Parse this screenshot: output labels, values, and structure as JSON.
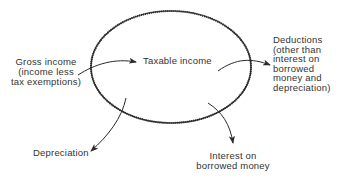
{
  "diagram": {
    "center_label": "Taxable income",
    "inflow": {
      "label_lines": [
        "Gross income",
        "(income less",
        "tax exemptions)"
      ]
    },
    "outflows": [
      {
        "id": "deductions",
        "label_lines": [
          "Deductions",
          "(other than",
          "interest on",
          "borrowed",
          "money and",
          "depreciation)"
        ]
      },
      {
        "id": "interest",
        "label_lines": [
          "Interest on",
          "borrowed money"
        ]
      },
      {
        "id": "depreciation",
        "label_lines": [
          "Depreciation"
        ]
      }
    ],
    "colors": {
      "stroke": "#2a2a2a",
      "text": "#333333",
      "background": "#ffffff"
    }
  }
}
